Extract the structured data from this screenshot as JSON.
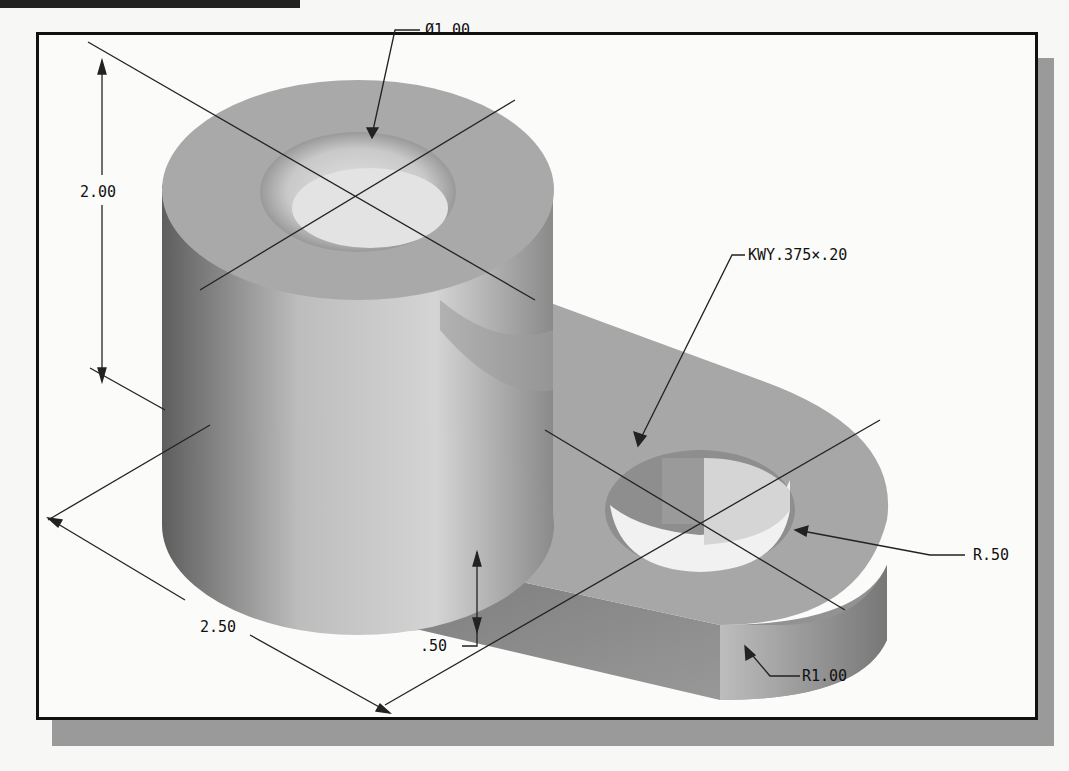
{
  "figure": {
    "type": "dimensioned isometric CAD part",
    "frame_shadow_color": "#9a9a9a",
    "part_colors": {
      "light": "#d9d9d9",
      "mid": "#a8a8a8",
      "dark": "#6e6e6e"
    }
  },
  "dimensions": {
    "hole_diameter": "Ø1.00",
    "height": "2.00",
    "keyway": "KWY.375×.20",
    "small_radius": "R.50",
    "large_radius": "R1.00",
    "length": "2.50",
    "thickness": ".50"
  }
}
